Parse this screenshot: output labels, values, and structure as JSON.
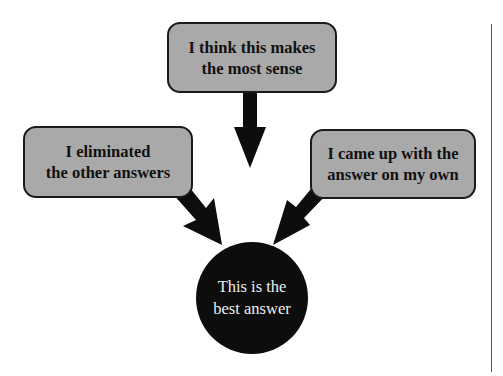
{
  "diagram": {
    "type": "flow-convergence",
    "colors": {
      "box_fill": "#a9a9a9",
      "box_border": "#1a1a1a",
      "arrow": "#0d0d0d",
      "target_fill": "#0d0d0d",
      "target_text": "#ededed",
      "background": "#ffffff"
    },
    "sources": {
      "top": {
        "line1": "I think this makes",
        "line2": "the most sense"
      },
      "left": {
        "line1": "I eliminated",
        "line2": "the other answers"
      },
      "right": {
        "line1": "I came up with the",
        "line2": "answer on my own"
      }
    },
    "target": {
      "line1": "This is the",
      "line2": "best answer"
    },
    "edges": [
      {
        "from": "top",
        "to": "target"
      },
      {
        "from": "left",
        "to": "target"
      },
      {
        "from": "right",
        "to": "target"
      }
    ]
  }
}
